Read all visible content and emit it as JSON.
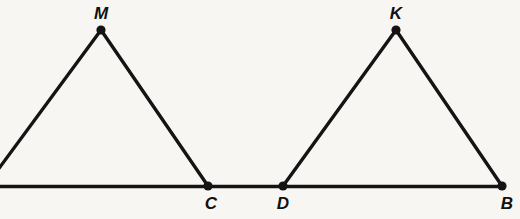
{
  "figure": {
    "kind": "geometry-diagram",
    "width": 520,
    "height": 219,
    "background_color": "#f7f6f3",
    "stroke_color": "#141414",
    "label_color": "#111111"
  },
  "baseline": {
    "name": "base-line",
    "x1": 0,
    "y1": 186.5,
    "x2": 505,
    "y2": 186.5,
    "thickness": 3.6
  },
  "points": [
    {
      "id": "M",
      "label": "M",
      "x": 101,
      "y": 30,
      "label_x": 101,
      "label_y": 13,
      "dot_radius": 4.6
    },
    {
      "id": "C",
      "label": "C",
      "x": 208,
      "y": 186,
      "label_x": 211,
      "label_y": 203,
      "dot_radius": 4.6
    },
    {
      "id": "D",
      "label": "D",
      "x": 283,
      "y": 186,
      "label_x": 283,
      "label_y": 203,
      "dot_radius": 4.6
    },
    {
      "id": "K",
      "label": "K",
      "x": 396,
      "y": 30,
      "label_x": 396,
      "label_y": 13,
      "dot_radius": 4.6
    },
    {
      "id": "B",
      "label": "B",
      "x": 502,
      "y": 186,
      "label_x": 507,
      "label_y": 203,
      "dot_radius": 4.6
    }
  ],
  "segments": [
    {
      "name": "segment-M-left-leg",
      "x1": -14,
      "y1": 186,
      "x2": 101,
      "y2": 30,
      "thickness": 3.4,
      "clipped": true
    },
    {
      "name": "segment-M-C",
      "x1": 101,
      "y1": 30,
      "x2": 208,
      "y2": 186,
      "thickness": 3.4,
      "clipped": false
    },
    {
      "name": "segment-D-K",
      "x1": 283,
      "y1": 186,
      "x2": 396,
      "y2": 30,
      "thickness": 3.4,
      "clipped": false
    },
    {
      "name": "segment-K-B",
      "x1": 396,
      "y1": 30,
      "x2": 502,
      "y2": 186,
      "thickness": 3.4,
      "clipped": false
    }
  ],
  "triangles": [
    {
      "name": "triangle-left",
      "vertices": [
        "M",
        "C"
      ],
      "note": "left base vertex is outside the image frame"
    },
    {
      "name": "triangle-right",
      "vertices": [
        "D",
        "K",
        "B"
      ],
      "note": "fully visible"
    }
  ]
}
